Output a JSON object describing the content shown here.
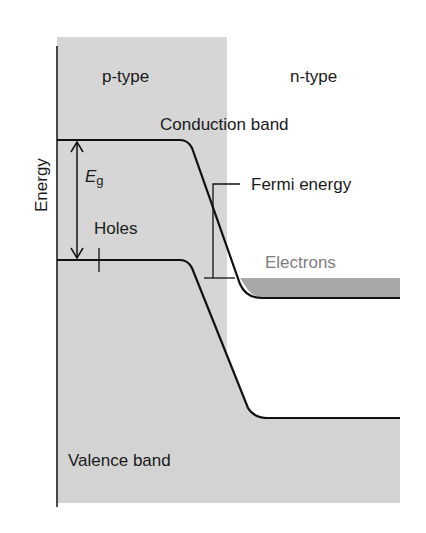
{
  "diagram": {
    "axis_label": "Energy",
    "regions": {
      "p_type": "p-type",
      "n_type": "n-type"
    },
    "bands": {
      "conduction": "Conduction band",
      "valence": "Valence band"
    },
    "annotations": {
      "band_gap_symbol": "E",
      "band_gap_subscript": "g",
      "holes": "Holes",
      "fermi_energy": "Fermi energy",
      "electrons": "Electrons"
    },
    "colors": {
      "p_region_fill": "#d6d6d6",
      "valence_fill": "#d3d3d3",
      "electron_fill": "#a8a8a8",
      "line": "#111111",
      "electron_label": "#7d7d7d",
      "background": "#ffffff"
    }
  }
}
